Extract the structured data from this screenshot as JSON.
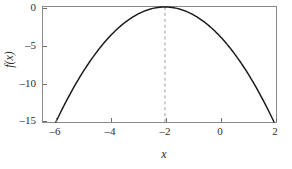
{
  "chart_data": {
    "type": "line",
    "title": "",
    "subtitle": "",
    "xlabel": "x",
    "ylabel": "f(x)",
    "xlim": [
      -6.6,
      2.4
    ],
    "ylim": [
      -16.5,
      0.6
    ],
    "grid": false,
    "legend": null,
    "series": [
      {
        "name": "f(x) = -(x + 2)^2",
        "expression": "-(x+2)^2",
        "color": "#1a1a1a",
        "linewidth": 1.5,
        "style": "solid",
        "x": [
          -6.0,
          -5.5,
          -5.0,
          -4.5,
          -4.0,
          -3.5,
          -3.0,
          -2.5,
          -2.0,
          -1.5,
          -1.0,
          -0.5,
          0.0,
          0.5,
          1.0,
          1.5,
          2.0
        ],
        "y": [
          -16.0,
          -12.25,
          -9.0,
          -6.25,
          -4.0,
          -2.25,
          -1.0,
          -0.25,
          0.0,
          -0.25,
          -1.0,
          -2.25,
          -4.0,
          -6.25,
          -9.0,
          -12.25,
          -16.0
        ]
      }
    ],
    "annotations": [
      {
        "name": "axis-of-symmetry",
        "type": "vertical-dashed-line",
        "x": -2,
        "color": "#9a9a9a",
        "style": "dashed"
      }
    ],
    "vertex": {
      "x": -2,
      "y": 0
    },
    "xticks": [
      -6,
      -4,
      -2,
      0,
      2
    ],
    "xticklabels": [
      "–6",
      "–4",
      "–2",
      "0",
      "2"
    ],
    "yticks": [
      0,
      -5,
      -10,
      -15
    ],
    "yticklabels": [
      "0",
      "–5",
      "–10",
      "–15"
    ],
    "frame_color": "#8a8a8a",
    "background": "#ffffff"
  }
}
